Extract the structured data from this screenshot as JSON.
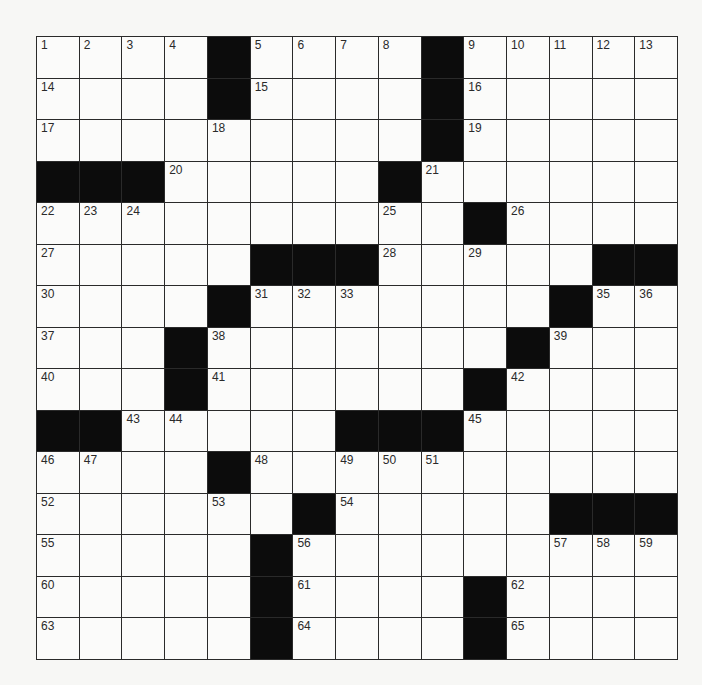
{
  "puzzle": {
    "rows": 15,
    "cols": 15,
    "colors": {
      "black": "#0c0c0c",
      "white": "#fbfbfa",
      "line": "#2a2a2a"
    },
    "layout": [
      "....#....#.....",
      "....#....#.....",
      ".........#.....",
      "###.....#......",
      "..........#....",
      ".....###.....##",
      "....#.......#..",
      "...#.......#...",
      "...#......#....",
      "##.....###.....",
      "....#..........",
      "......#.....###",
      ".....#.........",
      ".....#....#....",
      ".....#....#...."
    ],
    "numbers": [
      [
        1,
        0,
        0
      ],
      [
        2,
        0,
        1
      ],
      [
        3,
        0,
        2
      ],
      [
        4,
        0,
        3
      ],
      [
        5,
        0,
        5
      ],
      [
        6,
        0,
        6
      ],
      [
        7,
        0,
        7
      ],
      [
        8,
        0,
        8
      ],
      [
        9,
        0,
        10
      ],
      [
        10,
        0,
        11
      ],
      [
        11,
        0,
        12
      ],
      [
        12,
        0,
        13
      ],
      [
        13,
        0,
        14
      ],
      [
        14,
        1,
        0
      ],
      [
        15,
        1,
        5
      ],
      [
        16,
        1,
        10
      ],
      [
        17,
        2,
        0
      ],
      [
        18,
        2,
        4
      ],
      [
        19,
        2,
        10
      ],
      [
        20,
        3,
        3
      ],
      [
        21,
        3,
        9
      ],
      [
        22,
        4,
        0
      ],
      [
        23,
        4,
        1
      ],
      [
        24,
        4,
        2
      ],
      [
        25,
        4,
        8
      ],
      [
        26,
        4,
        11
      ],
      [
        27,
        5,
        0
      ],
      [
        28,
        5,
        8
      ],
      [
        29,
        5,
        10
      ],
      [
        30,
        6,
        0
      ],
      [
        31,
        6,
        5
      ],
      [
        32,
        6,
        6
      ],
      [
        33,
        6,
        7
      ],
      [
        34,
        6,
        12
      ],
      [
        35,
        6,
        13
      ],
      [
        36,
        6,
        14
      ],
      [
        37,
        7,
        0
      ],
      [
        38,
        7,
        4
      ],
      [
        39,
        7,
        12
      ],
      [
        40,
        8,
        0
      ],
      [
        41,
        8,
        4
      ],
      [
        42,
        8,
        11
      ],
      [
        43,
        9,
        2
      ],
      [
        44,
        9,
        3
      ],
      [
        45,
        9,
        10
      ],
      [
        46,
        10,
        0
      ],
      [
        47,
        10,
        1
      ],
      [
        48,
        10,
        5
      ],
      [
        49,
        10,
        7
      ],
      [
        50,
        10,
        8
      ],
      [
        51,
        10,
        9
      ],
      [
        52,
        11,
        0
      ],
      [
        53,
        11,
        4
      ],
      [
        54,
        11,
        7
      ],
      [
        55,
        12,
        0
      ],
      [
        56,
        12,
        6
      ],
      [
        57,
        12,
        12
      ],
      [
        58,
        12,
        13
      ],
      [
        59,
        12,
        14
      ],
      [
        60,
        13,
        0
      ],
      [
        61,
        13,
        6
      ],
      [
        62,
        13,
        11
      ],
      [
        63,
        14,
        0
      ],
      [
        64,
        14,
        6
      ],
      [
        65,
        14,
        11
      ]
    ]
  }
}
